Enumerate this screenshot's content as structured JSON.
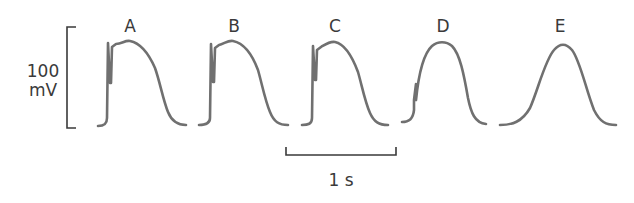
{
  "figure": {
    "traces": [
      {
        "label": "A",
        "label_x": 130,
        "description": "action potential with fast upstroke and notch"
      },
      {
        "label": "B",
        "label_x": 234,
        "description": "action potential with fast upstroke and notch"
      },
      {
        "label": "C",
        "label_x": 335,
        "description": "action potential with fast upstroke and notch"
      },
      {
        "label": "D",
        "label_x": 443,
        "description": "action potential with reduced upstroke"
      },
      {
        "label": "E",
        "label_x": 560,
        "description": "slow-response action potential"
      }
    ],
    "y_scale": {
      "value": "100",
      "unit": "mV"
    },
    "x_scale": {
      "label": "1 s"
    },
    "colors": {
      "trace": "#707070",
      "axis": "#3a3a3a",
      "text": "#3a3a3a"
    }
  }
}
